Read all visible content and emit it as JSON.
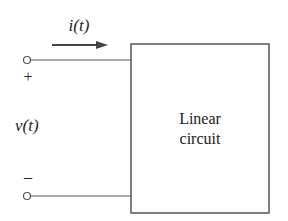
{
  "diagram": {
    "current_label": "i(t)",
    "voltage_label": "v(t)",
    "plus_sign": "+",
    "minus_sign": "–",
    "box_label_line1": "Linear",
    "box_label_line2": "circuit",
    "colors": {
      "line": "#555555",
      "arrow": "#444444",
      "text": "#222222"
    }
  }
}
